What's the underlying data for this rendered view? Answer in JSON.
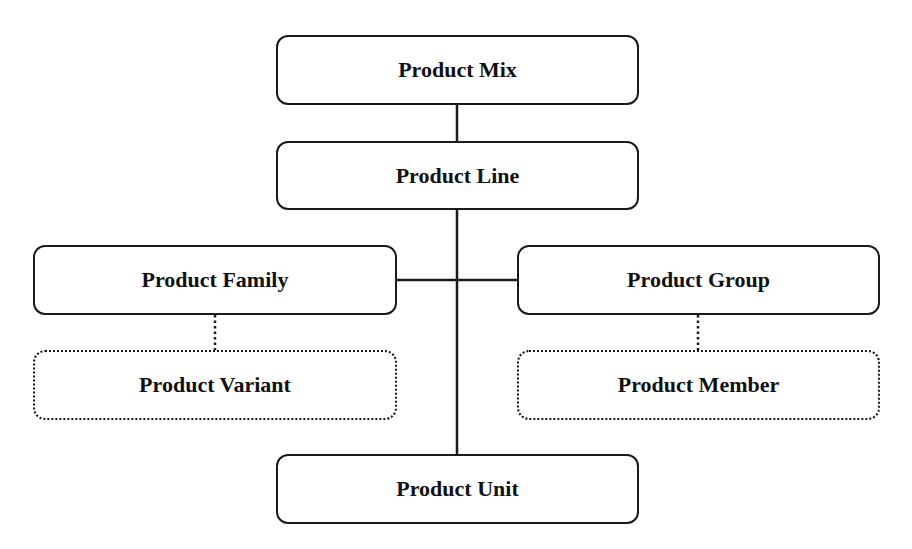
{
  "diagram": {
    "type": "hierarchy",
    "nodes": {
      "mix": {
        "label": "Product Mix",
        "style": "solid"
      },
      "line": {
        "label": "Product Line",
        "style": "solid"
      },
      "family": {
        "label": "Product Family",
        "style": "solid"
      },
      "variant": {
        "label": "Product Variant",
        "style": "dotted"
      },
      "group": {
        "label": "Product Group",
        "style": "solid"
      },
      "member": {
        "label": "Product Member",
        "style": "dotted"
      },
      "unit": {
        "label": "Product Unit",
        "style": "solid"
      }
    },
    "edges": [
      {
        "from": "Product Mix",
        "to": "Product Line",
        "style": "solid"
      },
      {
        "from": "Product Line",
        "to": "Product Family",
        "style": "solid"
      },
      {
        "from": "Product Line",
        "to": "Product Group",
        "style": "solid"
      },
      {
        "from": "Product Line",
        "to": "Product Unit",
        "style": "solid"
      },
      {
        "from": "Product Family",
        "to": "Product Variant",
        "style": "dotted"
      },
      {
        "from": "Product Group",
        "to": "Product Member",
        "style": "dotted"
      }
    ],
    "colors": {
      "stroke": "#1a1a1a",
      "background": "#ffffff",
      "text": "#111111"
    }
  }
}
